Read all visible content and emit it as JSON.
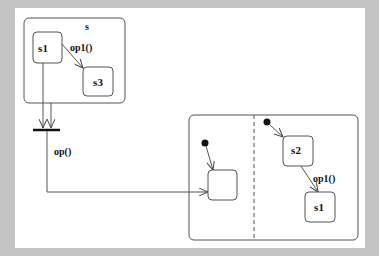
{
  "diagram": {
    "type": "uml-state-machine",
    "background_color": "#c4c4c4",
    "canvas_color": "#ffffff",
    "line_color": "#555555",
    "composite_s": {
      "name": "s",
      "states": [
        {
          "id": "s1",
          "label": "s1"
        },
        {
          "id": "s3",
          "label": "s3"
        }
      ],
      "transitions": [
        {
          "from": "s1",
          "to": "s3",
          "label": "op1()"
        }
      ]
    },
    "fork_join": {
      "incoming_count": 2,
      "outgoing_label": "op()"
    },
    "concurrent_state": {
      "regions": [
        {
          "id": "region-left",
          "initial": true,
          "states": [
            {
              "id": "unnamed",
              "label": ""
            }
          ]
        },
        {
          "id": "region-right",
          "initial": true,
          "states": [
            {
              "id": "s2",
              "label": "s2"
            },
            {
              "id": "s1b",
              "label": "s1"
            }
          ],
          "transitions": [
            {
              "from": "s2",
              "to": "s1",
              "label": "op1()"
            }
          ]
        }
      ]
    }
  }
}
